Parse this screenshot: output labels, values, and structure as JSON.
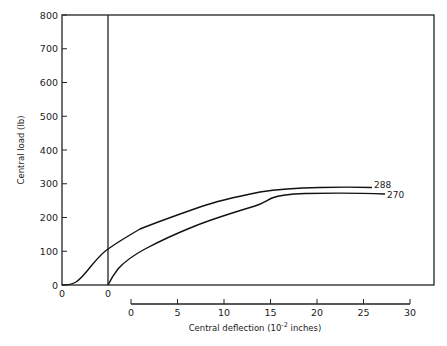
{
  "chart_data": {
    "type": "line",
    "title": "",
    "ylabel": "Central load (lb)",
    "xlabel": "Central deflection (10⁻² inches)",
    "xlabel_parts": {
      "main": "Central deflection (10",
      "sup": "-2",
      "tail": " inches)"
    },
    "ylim": [
      0,
      800
    ],
    "xlim": [
      0,
      30
    ],
    "y_ticks": [
      0,
      100,
      200,
      300,
      400,
      500,
      600,
      700,
      800
    ],
    "y_tick_labels": [
      "0",
      "100",
      "200",
      "300",
      "400",
      "500",
      "600",
      "700",
      "800"
    ],
    "x_ticks": [
      0,
      5,
      10,
      15,
      20,
      25,
      30
    ],
    "x_tick_labels": [
      "0",
      "5",
      "10",
      "15",
      "20",
      "25",
      "30"
    ],
    "offset_origin_labels": [
      "0",
      "0"
    ],
    "grid": false,
    "legend": "none; curves labeled at right end",
    "series": [
      {
        "name": "288",
        "label": "288",
        "note": "curve offset left (origin at left axis)",
        "x": [
          -5,
          -4,
          -3,
          -2,
          -1,
          0,
          1,
          3,
          5,
          7.5,
          10,
          12.5,
          15,
          17.5,
          20,
          22.5,
          25,
          26
        ],
        "y": [
          0,
          5,
          25,
          55,
          80,
          107,
          120,
          150,
          175,
          200,
          225,
          245,
          265,
          280,
          287,
          288,
          288,
          288
        ]
      },
      {
        "name": "270",
        "label": "270",
        "note": "curve origin at inner vertical line",
        "x": [
          0,
          0.5,
          1,
          2,
          4,
          6,
          8,
          10,
          12,
          13.5,
          15,
          17.5,
          20,
          22.5,
          25,
          27.3
        ],
        "y": [
          0,
          15,
          35,
          60,
          100,
          135,
          160,
          185,
          205,
          220,
          245,
          265,
          272,
          272,
          271,
          270
        ]
      }
    ]
  }
}
